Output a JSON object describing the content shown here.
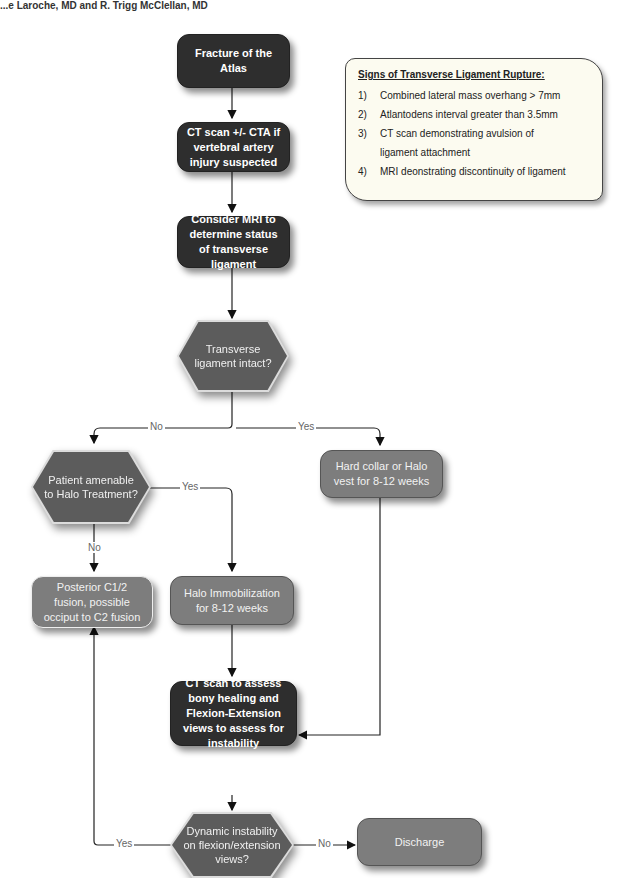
{
  "header": {
    "authors": "...e Laroche, MD and R. Trigg McClellan, MD"
  },
  "colors": {
    "dark_box": "#2e2e2e",
    "mid_box": "#7d7d7d",
    "decision": "#5c5c5c",
    "note_bg": "#fcfbf0"
  },
  "nodes": {
    "fracture": "Fracture of the Atlas",
    "ct_scan": "CT scan +/- CTA if vertebral artery injury suspected",
    "mri": "Consider MRI to determine status of transverse ligament",
    "ligament_intact": "Transverse ligament intact?",
    "halo_amenable": "Patient amenable to Halo Treatment?",
    "hard_collar": "Hard collar or Halo vest for 8-12 weeks",
    "posterior_fusion": "Posterior C1/2 fusion, possible occiput to C2 fusion",
    "halo_immobilization": "Halo Immobilization for 8-12 weeks",
    "ct_assess": "CT scan to assess bony healing and Flexion-Extension views to assess for instability",
    "dynamic_instability": "Dynamic instability on flexion/extension views?",
    "discharge": "Discharge"
  },
  "edge_labels": {
    "ligament_no": "No",
    "ligament_yes": "Yes",
    "halo_yes": "Yes",
    "halo_no": "No",
    "instability_yes": "Yes",
    "instability_no": "No"
  },
  "note": {
    "title": "Signs of Transverse Ligament Rupture:",
    "items": [
      {
        "num": "1)",
        "text": "Combined lateral mass overhang > 7mm"
      },
      {
        "num": "2)",
        "text": "Atlantodens interval greater than 3.5mm"
      },
      {
        "num": "3)",
        "text": "CT scan demonstrating avulsion of"
      },
      {
        "num": "",
        "text": "ligament attachment"
      },
      {
        "num": "4)",
        "text": "MRI deonstrating discontinuity of ligament"
      }
    ]
  }
}
